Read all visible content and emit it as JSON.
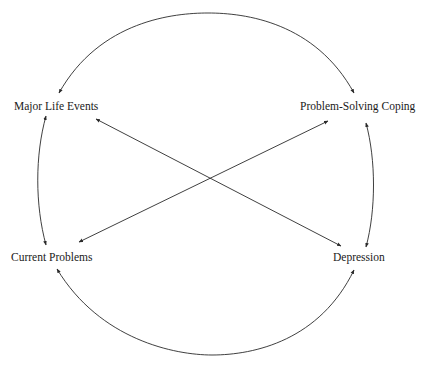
{
  "diagram": {
    "type": "bidirectional-relationship-diagram",
    "nodes": [
      {
        "id": "major_life_events",
        "label": "Major Life Events",
        "x": 14,
        "y": 101
      },
      {
        "id": "problem_solving_coping",
        "label": "Problem-Solving Coping",
        "x": 300,
        "y": 101
      },
      {
        "id": "current_problems",
        "label": "Current Problems",
        "x": 11,
        "y": 252
      },
      {
        "id": "depression",
        "label": "Depression",
        "x": 333,
        "y": 252
      }
    ],
    "edges": [
      {
        "from": "major_life_events",
        "to": "problem_solving_coping",
        "shape": "arc-top",
        "direction": "bidirectional"
      },
      {
        "from": "problem_solving_coping",
        "to": "depression",
        "shape": "arc-right",
        "direction": "bidirectional"
      },
      {
        "from": "current_problems",
        "to": "depression",
        "shape": "arc-bottom",
        "direction": "bidirectional"
      },
      {
        "from": "major_life_events",
        "to": "current_problems",
        "shape": "arc-left",
        "direction": "bidirectional"
      },
      {
        "from": "major_life_events",
        "to": "depression",
        "shape": "straight-diagonal",
        "direction": "bidirectional"
      },
      {
        "from": "problem_solving_coping",
        "to": "current_problems",
        "shape": "straight-diagonal",
        "direction": "bidirectional"
      }
    ],
    "colors": {
      "background": "#ffffff",
      "line": "#2a2a2a",
      "text": "#1a1a1a"
    }
  }
}
